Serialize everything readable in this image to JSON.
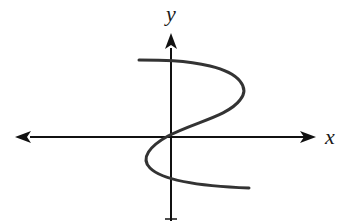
{
  "figure": {
    "type": "coordinate-plane-curve",
    "axes": {
      "x_label": "x",
      "y_label": "y",
      "x_axis_arrows": "both",
      "y_axis_arrows": "top",
      "color": "#111111"
    },
    "curve": {
      "color": "#333333",
      "stroke_width": 3,
      "description": "Starts at upper left, crosses y-axis, bends right, sweeps back through origin, bends left below x-axis, crosses y-axis again, ends at lower right"
    }
  }
}
